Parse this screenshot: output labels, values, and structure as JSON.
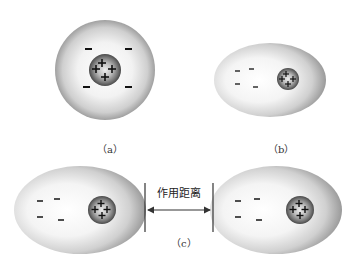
{
  "panels": {
    "a": {
      "label": "（a）",
      "description": "Atom with spherical electron cloud centered on nucleus"
    },
    "b": {
      "label": "（b）",
      "description": "Polarized atom with electron cloud shifted away from nucleus"
    },
    "c": {
      "label": "（c）",
      "description": "Two polarized atoms separated by interaction distance"
    }
  },
  "annotations": {
    "interaction_distance": "作用距离"
  },
  "symbols": {
    "positive": "+",
    "negative": "−"
  },
  "colors": {
    "cloud_center": "#ffffff",
    "cloud_edge": "#9a9a9a",
    "nucleus_center": "#e8e8e8",
    "nucleus_edge": "#555555",
    "line": "#333333"
  }
}
